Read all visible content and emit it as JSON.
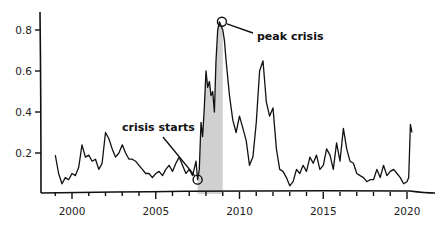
{
  "chart_data": {
    "type": "line",
    "title": "",
    "xlabel": "",
    "ylabel": "",
    "xlim": [
      1998.5,
      2022
    ],
    "ylim": [
      0,
      0.9
    ],
    "grid": false,
    "x_ticks": [
      2000,
      2005,
      2010,
      2015,
      2020
    ],
    "x_tick_labels": [
      "2000",
      "2005",
      "2010",
      "2015",
      "2020"
    ],
    "y_ticks": [
      0.2,
      0.4,
      0.6,
      0.8
    ],
    "y_tick_labels": [
      "0.2",
      "0.4",
      "0.6",
      "0.8"
    ],
    "shaded_region": {
      "x_start": 2007.5,
      "x_end": 2009.0,
      "color": "#c8c8c8"
    },
    "annotations": [
      {
        "text": "crisis starts",
        "x": 2007.5,
        "y": 0.07
      },
      {
        "text": "peak crisis",
        "x": 2008.95,
        "y": 0.84
      }
    ],
    "series": [
      {
        "name": "index",
        "color": "#111111",
        "x": [
          1999.0,
          1999.2,
          1999.4,
          1999.6,
          1999.8,
          2000.0,
          2000.2,
          2000.4,
          2000.6,
          2000.8,
          2001.0,
          2001.2,
          2001.4,
          2001.6,
          2001.8,
          2002.0,
          2002.2,
          2002.4,
          2002.6,
          2002.8,
          2003.0,
          2003.2,
          2003.4,
          2003.6,
          2003.8,
          2004.0,
          2004.2,
          2004.4,
          2004.6,
          2004.8,
          2005.0,
          2005.2,
          2005.4,
          2005.6,
          2005.8,
          2006.0,
          2006.2,
          2006.4,
          2006.6,
          2006.8,
          2007.0,
          2007.2,
          2007.4,
          2007.5,
          2007.6,
          2007.7,
          2007.8,
          2007.9,
          2008.0,
          2008.1,
          2008.2,
          2008.3,
          2008.4,
          2008.5,
          2008.6,
          2008.7,
          2008.8,
          2008.9,
          2009.0,
          2009.1,
          2009.2,
          2009.4,
          2009.6,
          2009.8,
          2010.0,
          2010.2,
          2010.4,
          2010.6,
          2010.8,
          2011.0,
          2011.2,
          2011.4,
          2011.6,
          2011.8,
          2012.0,
          2012.2,
          2012.4,
          2012.6,
          2012.8,
          2013.0,
          2013.2,
          2013.4,
          2013.6,
          2013.8,
          2014.0,
          2014.2,
          2014.4,
          2014.6,
          2014.8,
          2015.0,
          2015.2,
          2015.4,
          2015.6,
          2015.8,
          2016.0,
          2016.2,
          2016.4,
          2016.6,
          2016.8,
          2017.0,
          2017.2,
          2017.4,
          2017.6,
          2017.8,
          2018.0,
          2018.2,
          2018.4,
          2018.6,
          2018.8,
          2019.0,
          2019.2,
          2019.4,
          2019.6,
          2019.8,
          2020.0,
          2020.1,
          2020.2,
          2020.3
        ],
        "values": [
          0.19,
          0.1,
          0.05,
          0.08,
          0.07,
          0.1,
          0.09,
          0.13,
          0.24,
          0.18,
          0.19,
          0.16,
          0.17,
          0.12,
          0.15,
          0.3,
          0.27,
          0.22,
          0.18,
          0.2,
          0.24,
          0.2,
          0.17,
          0.17,
          0.16,
          0.14,
          0.12,
          0.1,
          0.1,
          0.08,
          0.1,
          0.11,
          0.09,
          0.12,
          0.14,
          0.11,
          0.15,
          0.18,
          0.14,
          0.1,
          0.12,
          0.09,
          0.16,
          0.07,
          0.12,
          0.35,
          0.28,
          0.42,
          0.6,
          0.52,
          0.55,
          0.48,
          0.5,
          0.4,
          0.65,
          0.8,
          0.84,
          0.82,
          0.8,
          0.75,
          0.65,
          0.48,
          0.36,
          0.3,
          0.38,
          0.32,
          0.26,
          0.14,
          0.18,
          0.35,
          0.6,
          0.65,
          0.45,
          0.38,
          0.42,
          0.22,
          0.12,
          0.11,
          0.08,
          0.04,
          0.06,
          0.12,
          0.1,
          0.14,
          0.11,
          0.18,
          0.15,
          0.19,
          0.12,
          0.14,
          0.22,
          0.19,
          0.12,
          0.25,
          0.16,
          0.32,
          0.22,
          0.16,
          0.15,
          0.1,
          0.09,
          0.08,
          0.06,
          0.07,
          0.07,
          0.12,
          0.08,
          0.14,
          0.09,
          0.11,
          0.12,
          0.1,
          0.08,
          0.05,
          0.06,
          0.08,
          0.34,
          0.3
        ]
      }
    ]
  }
}
